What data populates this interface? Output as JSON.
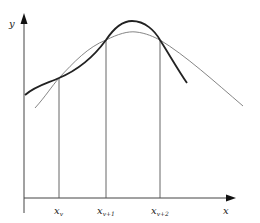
{
  "diagram": {
    "axes": {
      "x_label": "x",
      "y_label": "y"
    },
    "nodes": [
      {
        "label": "x",
        "subscript": "v"
      },
      {
        "label": "x",
        "subscript": "v+1"
      },
      {
        "label": "x",
        "subscript": "v+2"
      }
    ],
    "curves": [
      {
        "name": "approximating-spline",
        "weight": "bold",
        "color": "#222222"
      },
      {
        "name": "original-function",
        "weight": "thin",
        "color": "#555555"
      }
    ]
  }
}
